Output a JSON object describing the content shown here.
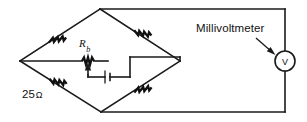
{
  "figure": {
    "width": 307,
    "height": 122,
    "background_color": "#ffffff",
    "line_color": "#1a1a1a"
  },
  "labels": {
    "millivoltmeter": "Millivoltmeter",
    "bridge_resistance_value": "25",
    "bridge_resistance_unit": "Ω",
    "potentiometer_symbol": "R",
    "potentiometer_subscript": "b",
    "meter_glyph": "V"
  },
  "components": {
    "resistor_top_left": "resistor",
    "resistor_top_right": "resistor",
    "resistor_bottom_left": "resistor",
    "resistor_bottom_right": "resistor",
    "potentiometer": "variable-resistor",
    "battery": "battery-cell",
    "meter": "voltmeter"
  },
  "geometry": {
    "diamond_left_vertex": [
      20,
      61
    ],
    "diamond_top_vertex": [
      100,
      9
    ],
    "diamond_right_vertex": [
      180,
      61
    ],
    "diamond_bottom_vertex": [
      101,
      112
    ],
    "meter_center": [
      285,
      61
    ],
    "meter_radius": 10
  }
}
